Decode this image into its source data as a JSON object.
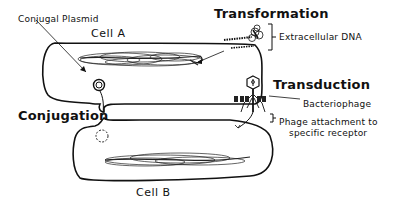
{
  "labels": {
    "conjugal_plasmid": "Conjugal Plasmid",
    "cell_a": "Cell A",
    "cell_b": "Cell B",
    "transformation": "Transformation",
    "extracellular_dna": "Extracellular DNA",
    "transduction": "Transduction",
    "bacteriophage": "Bacteriophage",
    "phage_attachment_line1": "Phage attachment to",
    "phage_attachment_line2": "specific receptor",
    "conjugation": "Conjugation"
  }
}
